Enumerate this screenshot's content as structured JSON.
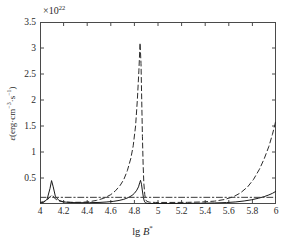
{
  "figure": {
    "exponent_label": "×10",
    "exponent_sup": "22",
    "ylabel_prefix": "ε(erg·cm",
    "ylabel_sup1": "−3",
    "ylabel_mid": "·s",
    "ylabel_sup2": "−1",
    "ylabel_suffix": ")",
    "xlabel_prefix": "lg ",
    "xlabel_var": "B",
    "xlabel_sup": "*"
  },
  "chart_data": {
    "type": "line",
    "title": "",
    "xlabel": "lg B*",
    "ylabel": "ε(erg·cm⁻³·s⁻¹)",
    "y_scale_exponent": 22,
    "y_scale_label": "×10^22",
    "xlim": [
      4.0,
      6.0
    ],
    "ylim": [
      0.0,
      3.5
    ],
    "xticks": [
      4,
      4.2,
      4.4,
      4.6,
      4.8,
      5,
      5.2,
      5.4,
      5.6,
      5.8,
      6
    ],
    "xtick_labels": [
      "4",
      "4.2",
      "4.4",
      "4.6",
      "4.8",
      "5",
      "5.2",
      "5.4",
      "5.6",
      "5.8",
      "6"
    ],
    "yticks": [
      0.5,
      1,
      1.5,
      2,
      2.5,
      3,
      3.5
    ],
    "ytick_labels": [
      "0.5",
      "1",
      "1.5",
      "2",
      "2.5",
      "3",
      "3.5"
    ],
    "grid": false,
    "legend": "none",
    "series": [
      {
        "name": "dashed-curve",
        "style": "dashed",
        "color": "#2b2b2b",
        "points": [
          [
            4.0,
            0.03
          ],
          [
            4.03,
            0.045
          ],
          [
            4.06,
            0.075
          ],
          [
            4.09,
            0.15
          ],
          [
            4.105,
            0.175
          ],
          [
            4.12,
            0.12
          ],
          [
            4.15,
            0.065
          ],
          [
            4.2,
            0.04
          ],
          [
            4.28,
            0.032
          ],
          [
            4.36,
            0.033
          ],
          [
            4.42,
            0.045
          ],
          [
            4.48,
            0.07
          ],
          [
            4.54,
            0.11
          ],
          [
            4.6,
            0.18
          ],
          [
            4.64,
            0.255
          ],
          [
            4.68,
            0.36
          ],
          [
            4.71,
            0.47
          ],
          [
            4.74,
            0.64
          ],
          [
            4.77,
            0.88
          ],
          [
            4.79,
            1.12
          ],
          [
            4.81,
            1.5
          ],
          [
            4.825,
            2.0
          ],
          [
            4.838,
            2.56
          ],
          [
            4.848,
            3.1
          ],
          [
            4.856,
            2.7
          ],
          [
            4.862,
            2.0
          ],
          [
            4.868,
            1.3
          ],
          [
            4.874,
            0.76
          ],
          [
            4.88,
            0.4
          ],
          [
            4.888,
            0.18
          ],
          [
            4.895,
            0.085
          ],
          [
            4.905,
            0.05
          ],
          [
            4.93,
            0.035
          ],
          [
            4.98,
            0.03
          ],
          [
            5.1,
            0.03
          ],
          [
            5.25,
            0.032
          ],
          [
            5.38,
            0.04
          ],
          [
            5.48,
            0.055
          ],
          [
            5.56,
            0.085
          ],
          [
            5.64,
            0.14
          ],
          [
            5.7,
            0.215
          ],
          [
            5.76,
            0.33
          ],
          [
            5.81,
            0.475
          ],
          [
            5.86,
            0.67
          ],
          [
            5.9,
            0.87
          ],
          [
            5.94,
            1.11
          ],
          [
            5.97,
            1.34
          ],
          [
            5.99,
            1.52
          ],
          [
            6.0,
            1.62
          ]
        ]
      },
      {
        "name": "solid-curve",
        "style": "solid",
        "color": "#1a1a1a",
        "points": [
          [
            4.0,
            0.02
          ],
          [
            4.03,
            0.03
          ],
          [
            4.06,
            0.09
          ],
          [
            4.085,
            0.3
          ],
          [
            4.098,
            0.45
          ],
          [
            4.112,
            0.33
          ],
          [
            4.13,
            0.15
          ],
          [
            4.16,
            0.07
          ],
          [
            4.2,
            0.04
          ],
          [
            4.26,
            0.028
          ],
          [
            4.34,
            0.025
          ],
          [
            4.42,
            0.026
          ],
          [
            4.5,
            0.03
          ],
          [
            4.56,
            0.038
          ],
          [
            4.62,
            0.05
          ],
          [
            4.67,
            0.068
          ],
          [
            4.71,
            0.09
          ],
          [
            4.75,
            0.125
          ],
          [
            4.78,
            0.165
          ],
          [
            4.8,
            0.205
          ],
          [
            4.82,
            0.265
          ],
          [
            4.835,
            0.33
          ],
          [
            4.845,
            0.41
          ],
          [
            4.852,
            0.455
          ],
          [
            4.86,
            0.38
          ],
          [
            4.868,
            0.25
          ],
          [
            4.876,
            0.13
          ],
          [
            4.884,
            0.055
          ],
          [
            4.894,
            0.022
          ],
          [
            4.91,
            0.012
          ],
          [
            4.96,
            0.01
          ],
          [
            5.08,
            0.01
          ],
          [
            5.22,
            0.012
          ],
          [
            5.36,
            0.015
          ],
          [
            5.48,
            0.02
          ],
          [
            5.58,
            0.028
          ],
          [
            5.66,
            0.04
          ],
          [
            5.73,
            0.058
          ],
          [
            5.79,
            0.08
          ],
          [
            5.85,
            0.11
          ],
          [
            5.9,
            0.142
          ],
          [
            5.94,
            0.175
          ],
          [
            5.97,
            0.205
          ],
          [
            6.0,
            0.245
          ]
        ]
      },
      {
        "name": "dash-dot-baseline",
        "style": "dashdot",
        "color": "#3a3a3a",
        "points": [
          [
            4.0,
            0.128
          ],
          [
            6.0,
            0.128
          ]
        ]
      }
    ]
  }
}
